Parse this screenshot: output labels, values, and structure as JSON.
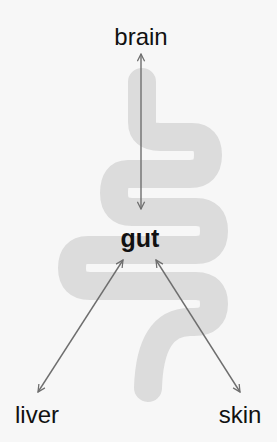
{
  "diagram": {
    "center_node": {
      "label": "gut"
    },
    "nodes": [
      {
        "id": "brain",
        "label": "brain"
      },
      {
        "id": "liver",
        "label": "liver"
      },
      {
        "id": "skin",
        "label": "skin"
      }
    ],
    "edges": [
      {
        "from": "brain",
        "to": "gut",
        "direction": "bidirectional"
      },
      {
        "from": "liver",
        "to": "gut",
        "direction": "bidirectional"
      },
      {
        "from": "skin",
        "to": "gut",
        "direction": "bidirectional"
      }
    ],
    "colors": {
      "background": "#f7f7f7",
      "intestine": "#dcdcdc",
      "arrow": "#6e6e6e",
      "text": "#111111"
    }
  }
}
